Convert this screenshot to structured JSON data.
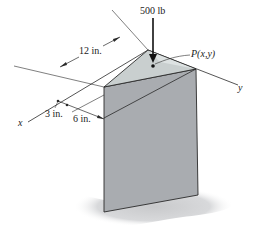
{
  "figure": {
    "load": {
      "label": "500 lb",
      "point_label": "P(x,y)"
    },
    "axes": {
      "x_label": "x",
      "y_label": "y"
    },
    "dimensions": [
      {
        "id": "dim-12",
        "label": "12 in."
      },
      {
        "id": "dim-3",
        "label": "3 in."
      },
      {
        "id": "dim-6",
        "label": "6 in."
      }
    ],
    "colors": {
      "top_face": "#c9cfcf",
      "top_face_light": "#dde2e2",
      "front_face": "#a9acb0",
      "shadow": "#d6d7d9",
      "line": "#2a2a2a"
    }
  }
}
